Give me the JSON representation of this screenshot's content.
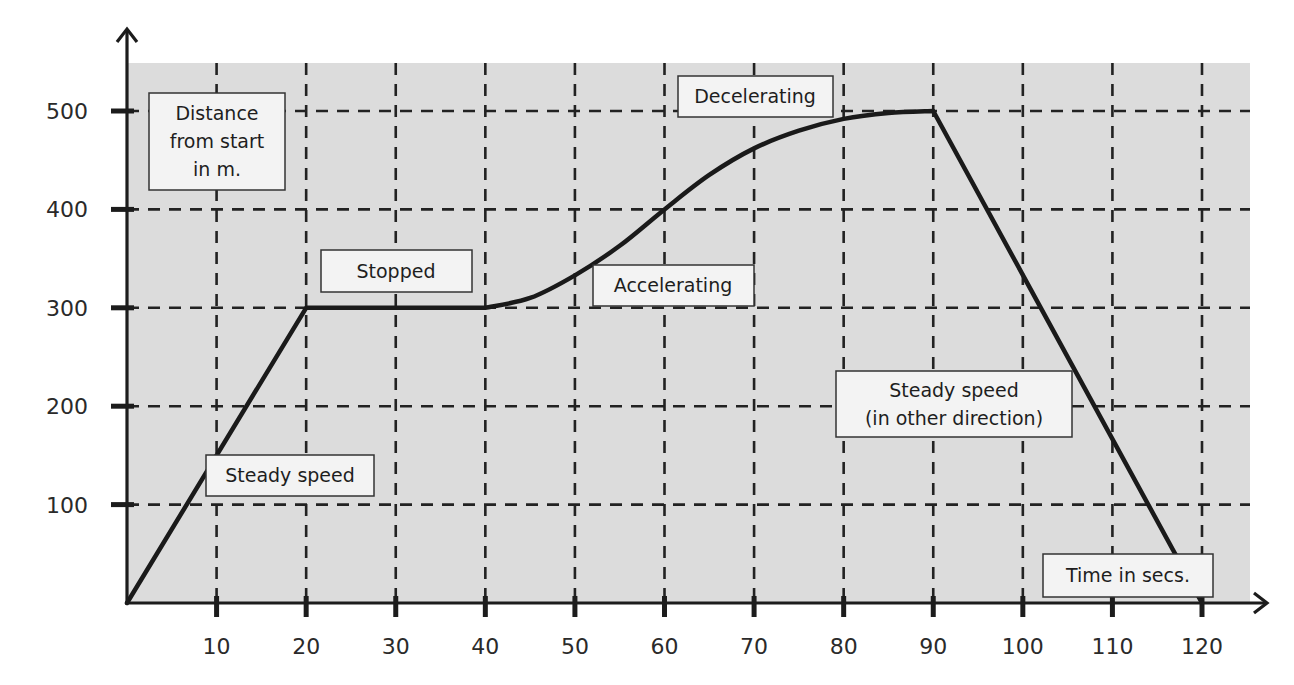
{
  "chart_data": {
    "type": "line",
    "title": "",
    "xlabel": "Time in secs.",
    "ylabel": "Distance from start in m.",
    "xlim": [
      0,
      120
    ],
    "ylim": [
      0,
      500
    ],
    "x_ticks": [
      10,
      20,
      30,
      40,
      50,
      60,
      70,
      80,
      90,
      100,
      110,
      120
    ],
    "x_tick_labels": [
      "10",
      "20",
      "30",
      "40",
      "50",
      "60",
      "70",
      "80",
      "90",
      "100",
      "110",
      "120"
    ],
    "y_ticks": [
      100,
      200,
      300,
      400,
      500
    ],
    "y_tick_labels": [
      "100",
      "200",
      "300",
      "400",
      "500"
    ],
    "grid": true,
    "grid_style": "dashed",
    "legend": null,
    "background_color": "#dcdcdc",
    "line_color": "#1a1a1a",
    "series": [
      {
        "name": "distance-time",
        "x": [
          0,
          20,
          40,
          45,
          50,
          55,
          60,
          65,
          70,
          75,
          80,
          85,
          90,
          120
        ],
        "y": [
          0,
          300,
          300,
          310,
          333,
          363,
          400,
          435,
          462,
          480,
          492,
          498,
          500,
          0
        ]
      }
    ],
    "segments": [
      {
        "label": "Steady speed",
        "x_range": [
          0,
          20
        ],
        "y_range": [
          0,
          300
        ]
      },
      {
        "label": "Stopped",
        "x_range": [
          20,
          40
        ],
        "y_range": [
          300,
          300
        ]
      },
      {
        "label": "Accelerating",
        "x_range": [
          40,
          60
        ],
        "y_range": [
          300,
          400
        ]
      },
      {
        "label": "Decelerating",
        "x_range": [
          60,
          90
        ],
        "y_range": [
          400,
          500
        ]
      },
      {
        "label": "Steady speed (in other direction)",
        "x_range": [
          90,
          120
        ],
        "y_range": [
          500,
          0
        ]
      }
    ],
    "annotations": [
      {
        "text_lines": [
          "Distance",
          "from start",
          "in m."
        ],
        "role": "y-axis-label"
      },
      {
        "text_lines": [
          "Stopped"
        ],
        "role": "segment-label"
      },
      {
        "text_lines": [
          "Accelerating"
        ],
        "role": "segment-label"
      },
      {
        "text_lines": [
          "Decelerating"
        ],
        "role": "segment-label"
      },
      {
        "text_lines": [
          "Steady speed",
          "(in other direction)"
        ],
        "role": "segment-label"
      },
      {
        "text_lines": [
          "Steady speed"
        ],
        "role": "segment-label"
      },
      {
        "text_lines": [
          "Time in secs."
        ],
        "role": "x-axis-label"
      }
    ]
  },
  "labels": {
    "y_axis": {
      "line1": "Distance",
      "line2": "from start",
      "line3": "in m."
    },
    "x_axis": "Time in secs.",
    "stopped": "Stopped",
    "accelerating": "Accelerating",
    "decelerating": "Decelerating",
    "steady_speed": "Steady speed",
    "steady_other": {
      "line1": "Steady speed",
      "line2": "(in other direction)"
    }
  },
  "ticks": {
    "x": [
      "10",
      "20",
      "30",
      "40",
      "50",
      "60",
      "70",
      "80",
      "90",
      "100",
      "110",
      "120"
    ],
    "y": [
      "100",
      "200",
      "300",
      "400",
      "500"
    ]
  }
}
